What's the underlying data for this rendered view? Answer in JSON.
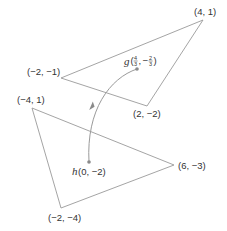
{
  "diagram": {
    "triangles": [
      {
        "name": "upper",
        "vertices": [
          {
            "label": "(4, 1)"
          },
          {
            "label": "(−2, −1)"
          },
          {
            "label": "(2, −2)"
          }
        ],
        "centroid": {
          "name": "g",
          "x_num": "4",
          "x_den": "3",
          "y_sign": "−",
          "y_num": "2",
          "y_den": "3"
        }
      },
      {
        "name": "lower",
        "vertices": [
          {
            "label": "(−4, 1)"
          },
          {
            "label": "(6, −3)"
          },
          {
            "label": "(−2, −4)"
          }
        ],
        "centroid": {
          "name": "h",
          "coords": "(0, −2)"
        }
      }
    ],
    "arrow": {
      "from": "g",
      "to": "h"
    },
    "colors": {
      "lines": "#9a9a9a",
      "text": "#333333",
      "points": "#8a8a8a"
    }
  }
}
